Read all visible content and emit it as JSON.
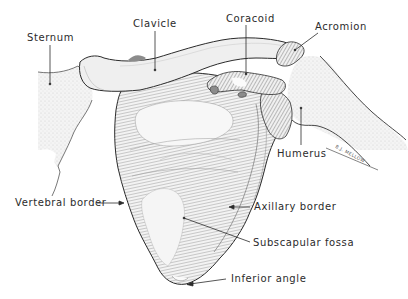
{
  "figure": {
    "background": "#ffffff",
    "ink_color": "#2b2b2b",
    "bone_fill": "#eeeeee",
    "shadow_fill": "#8c8c8c"
  },
  "labels": {
    "sternum": "Sternum",
    "clavicle": "Clavicle",
    "coracoid": "Coracoid",
    "acromion": "Acromion",
    "humerus": "Humerus",
    "vertebral_border": "Vertebral border",
    "axillary_border": "Axillary border",
    "subscapular_fossa": "Subscapular fossa",
    "inferior_angle": "Inferior angle"
  },
  "signature": "B.J. MELLOW"
}
